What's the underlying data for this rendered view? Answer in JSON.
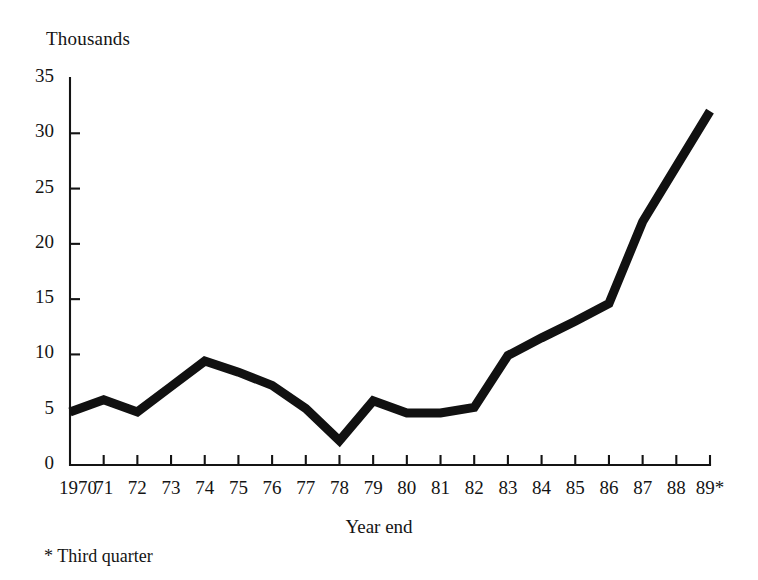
{
  "chart_data": {
    "type": "line",
    "title": "",
    "subtitle": "",
    "unit_label": "Thousands",
    "xlabel": "Year end",
    "ylabel": "",
    "footnote": "* Third quarter",
    "grid": false,
    "legend": "none",
    "ylim": [
      0,
      35
    ],
    "yticks": [
      0,
      5,
      10,
      15,
      20,
      25,
      30,
      35
    ],
    "ytick_labels": [
      "0",
      "5",
      "10",
      "15",
      "20",
      "25",
      "30",
      "35"
    ],
    "categories": [
      "1970",
      "71",
      "72",
      "73",
      "74",
      "75",
      "76",
      "77",
      "78",
      "79",
      "80",
      "81",
      "82",
      "83",
      "84",
      "85",
      "86",
      "87",
      "88",
      "89*"
    ],
    "x": [
      1970,
      1971,
      1972,
      1973,
      1974,
      1975,
      1976,
      1977,
      1978,
      1979,
      1980,
      1981,
      1982,
      1983,
      1984,
      1985,
      1986,
      1987,
      1988,
      1989
    ],
    "series": [
      {
        "name": "Thousands",
        "color": "#111111",
        "values": [
          4.8,
          5.9,
          4.8,
          7.1,
          9.4,
          8.4,
          7.2,
          5.1,
          2.2,
          5.8,
          4.7,
          4.7,
          5.2,
          9.9,
          11.5,
          13.0,
          14.6,
          22.0,
          27.0,
          32.0
        ]
      }
    ]
  }
}
